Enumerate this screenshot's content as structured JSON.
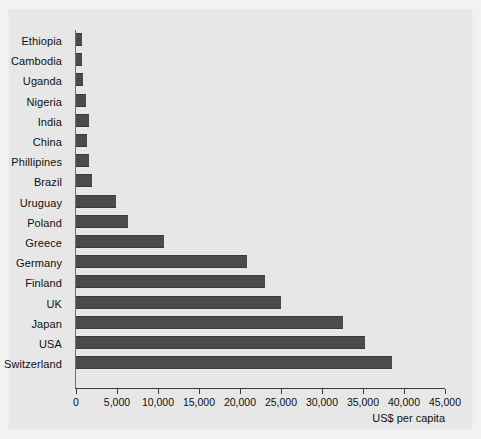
{
  "chart_data": {
    "type": "bar",
    "orientation": "horizontal",
    "title": "",
    "xlabel": "US$ per capita",
    "ylabel": "",
    "xlim": [
      0,
      45000
    ],
    "xticks": [
      0,
      5000,
      10000,
      15000,
      20000,
      25000,
      30000,
      35000,
      40000,
      45000
    ],
    "xtick_labels": [
      "0",
      "5,000",
      "10,000",
      "15,000",
      "20,000",
      "25,000",
      "30,000",
      "35,000",
      "40,000",
      "45,000"
    ],
    "grid": false,
    "legend": null,
    "categories": [
      "Ethiopia",
      "Cambodia",
      "Uganda",
      "Nigeria",
      "India",
      "China",
      "Phillipines",
      "Brazil",
      "Uruguay",
      "Poland",
      "Greece",
      "Germany",
      "Finland",
      "UK",
      "Japan",
      "USA",
      "Switzerland"
    ],
    "values": [
      700,
      750,
      850,
      1200,
      1600,
      1300,
      1600,
      2000,
      4900,
      6400,
      10700,
      20900,
      23000,
      25000,
      32600,
      35300,
      38500
    ],
    "bar_color": "#4b4b4b",
    "background_color": "#e7e7e7",
    "axis_color": "#3c3c3c"
  }
}
